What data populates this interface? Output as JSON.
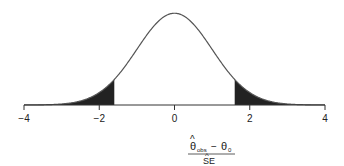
{
  "chart_data": {
    "type": "area",
    "title": "",
    "distribution": {
      "name": "normal",
      "mean": 0,
      "sd": 1
    },
    "shaded_regions": [
      {
        "from": -4,
        "to": -1.6,
        "tail": "lower"
      },
      {
        "from": 1.6,
        "to": 4,
        "tail": "upper"
      }
    ],
    "xlim": [
      -4,
      4
    ],
    "x_ticks": [
      -4,
      -2,
      0,
      2,
      4
    ],
    "x_tick_labels": [
      "−4",
      "−2",
      "0",
      "2",
      "4"
    ],
    "xlabel": {
      "numerator": "θ̂obs − θ0",
      "numerator_main": "θ",
      "numerator_hat": "^",
      "numerator_sub": "obs",
      "numerator_minus": "−",
      "numerator_theta0": "θ",
      "numerator_theta0_sub": "0",
      "denominator": "SE",
      "denominator_hat": "^"
    },
    "ylabel": "",
    "grid": false,
    "legend": null,
    "colors": {
      "curve": "#555555",
      "shade": "#222222",
      "axis": "#333333"
    }
  }
}
